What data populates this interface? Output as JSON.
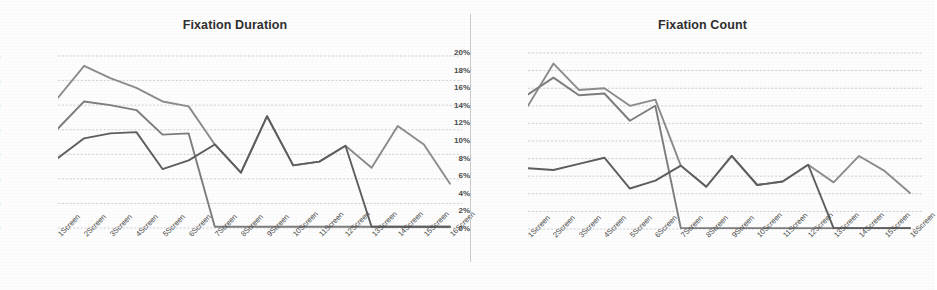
{
  "page": {
    "background_color": "#fdfdfd",
    "divider_color": "#c9c9c9"
  },
  "charts": [
    {
      "id": "fixation-duration",
      "title": "Fixation Duration"
    },
    {
      "id": "fixation-count",
      "title": "Fixation Count"
    }
  ],
  "chart_data": [
    {
      "type": "line",
      "title": "Fixation Duration",
      "xlabel": "",
      "ylabel": "",
      "ylim": [
        0,
        14
      ],
      "ytick_labels": [
        "0%",
        "2%",
        "4%",
        "6%",
        "8%",
        "10%",
        "12%",
        "14%"
      ],
      "ytick_values": [
        0,
        2,
        4,
        6,
        8,
        10,
        12,
        14
      ],
      "grid": true,
      "legend": "none",
      "categories": [
        "1Screen",
        "2Screen",
        "3Screen",
        "4Screen",
        "5Screen",
        "6Screen",
        "7Screen",
        "8Screen",
        "9Screen",
        "10Screen",
        "11Screen",
        "12Screen",
        "13Screen",
        "14Screen",
        "15Screen",
        "16Screen"
      ],
      "series": [
        {
          "name": "Series 1",
          "color": "#8c8c8c",
          "values": [
            10.6,
            13.2,
            12.2,
            11.4,
            10.3,
            9.9,
            6.8,
            4.5,
            9.1,
            5.1,
            5.4,
            6.7,
            4.9,
            8.3,
            6.8,
            3.6
          ]
        },
        {
          "name": "Series 2",
          "color": "#7d7d7d",
          "values": [
            8.1,
            10.3,
            10.0,
            9.6,
            7.6,
            7.7,
            0.1,
            0.1,
            0.1,
            0.1,
            0.1,
            0.1,
            0.1,
            0.1,
            0.1,
            0.1
          ]
        },
        {
          "name": "Series 3",
          "color": "#5e5e5e",
          "values": [
            5.7,
            7.3,
            7.7,
            7.8,
            4.8,
            5.5,
            6.8,
            4.5,
            9.1,
            5.1,
            5.4,
            6.7,
            0.1,
            0.1,
            0.1,
            0.1
          ]
        }
      ]
    },
    {
      "type": "line",
      "title": "Fixation Count",
      "xlabel": "",
      "ylabel": "",
      "ylim": [
        0,
        20
      ],
      "ytick_labels": [
        "0%",
        "2%",
        "4%",
        "6%",
        "8%",
        "10%",
        "12%",
        "14%",
        "16%",
        "18%",
        "20%"
      ],
      "ytick_values": [
        0,
        2,
        4,
        6,
        8,
        10,
        12,
        14,
        16,
        18,
        20
      ],
      "grid": true,
      "legend": "none",
      "categories": [
        "1Screen",
        "2Screen",
        "3Screen",
        "4Screen",
        "5Screen",
        "6Screen",
        "7Screen",
        "8Screen",
        "9Screen",
        "10Screen",
        "11Screen",
        "12Screen",
        "13Screen",
        "14Screen",
        "15Screen",
        "16Screen"
      ],
      "series": [
        {
          "name": "Series 1",
          "color": "#8c8c8c",
          "values": [
            14.0,
            18.8,
            15.8,
            16.0,
            14.0,
            14.7,
            7.2,
            4.8,
            8.3,
            5.0,
            5.4,
            7.3,
            5.3,
            8.3,
            6.6,
            4.1
          ]
        },
        {
          "name": "Series 2",
          "color": "#7d7d7d",
          "values": [
            15.3,
            17.2,
            15.2,
            15.4,
            12.3,
            14.0,
            0.1,
            0.1,
            0.1,
            0.1,
            0.1,
            0.1,
            0.1,
            0.1,
            0.1,
            0.1
          ]
        },
        {
          "name": "Series 3",
          "color": "#5e5e5e",
          "values": [
            6.9,
            6.7,
            7.4,
            8.1,
            4.6,
            5.5,
            7.2,
            4.8,
            8.3,
            5.0,
            5.4,
            7.3,
            0.1,
            0.1,
            0.1,
            0.1
          ]
        }
      ]
    }
  ]
}
